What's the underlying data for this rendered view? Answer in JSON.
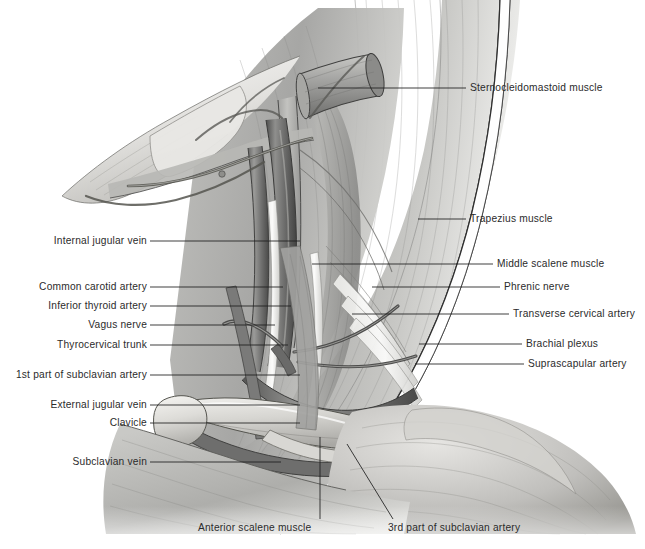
{
  "figure": {
    "background_color": "#ffffff",
    "label_color": "#2b2b2b",
    "leader_color": "#1e1e1e",
    "width": 645,
    "height": 549
  },
  "labels_left": [
    {
      "id": "internal-jugular-vein",
      "text": "Internal jugular vein",
      "x": 147,
      "y": 244,
      "leader": "M150,241 L300,241"
    },
    {
      "id": "common-carotid-artery",
      "text": "Common carotid artery",
      "x": 147,
      "y": 290,
      "leader": "M150,287 L283,287"
    },
    {
      "id": "inferior-thyroid-artery",
      "text": "Inferior thyroid artery",
      "x": 147,
      "y": 309,
      "leader": "M150,306 L291,306"
    },
    {
      "id": "vagus-nerve",
      "text": "Vagus nerve",
      "x": 147,
      "y": 328,
      "leader": "M150,325 L275,325"
    },
    {
      "id": "thyrocervical-trunk",
      "text": "Thyrocervical trunk",
      "x": 147,
      "y": 348,
      "leader": "M150,345 L288,345"
    },
    {
      "id": "first-part-subclavian",
      "text": "1st part of subclavian artery",
      "x": 147,
      "y": 378,
      "leader": "M150,375 L300,375"
    },
    {
      "id": "external-jugular-vein",
      "text": "External jugular vein",
      "x": 147,
      "y": 408,
      "leader": "M150,405 L300,405"
    },
    {
      "id": "clavicle",
      "text": "Clavicle",
      "x": 147,
      "y": 426,
      "leader": "M150,423 L300,423"
    },
    {
      "id": "subclavian-vein",
      "text": "Subclavian vein",
      "x": 147,
      "y": 465,
      "leader": "M150,462 L281,462"
    }
  ],
  "labels_right": [
    {
      "id": "sternocleidomastoid-muscle",
      "text": "Sternocleidomastoid muscle",
      "x": 470,
      "y": 91,
      "leader": "M466,88 L318,88"
    },
    {
      "id": "trapezius-muscle",
      "text": "Trapezius muscle",
      "x": 470,
      "y": 222,
      "leader": "M466,219 L418,219"
    },
    {
      "id": "middle-scalene-muscle",
      "text": "Middle scalene muscle",
      "x": 497,
      "y": 267,
      "leader": "M493,264 L312,264"
    },
    {
      "id": "phrenic-nerve",
      "text": "Phrenic nerve",
      "x": 504,
      "y": 290,
      "leader": "M500,287 L372,287"
    },
    {
      "id": "transverse-cervical-artery",
      "text": "Transverse cervical artery",
      "x": 513,
      "y": 317,
      "leader": "M509,314 L352,314"
    },
    {
      "id": "brachial-plexus",
      "text": "Brachial plexus",
      "x": 526,
      "y": 347,
      "leader": "M522,344 L419,344"
    },
    {
      "id": "suprascapular-artery",
      "text": "Suprascapular artery",
      "x": 528,
      "y": 367,
      "leader": "M524,364 L415,364"
    }
  ],
  "labels_bottom": [
    {
      "id": "anterior-scalene-muscle",
      "text": "Anterior scalene muscle",
      "x": 255,
      "y": 531,
      "leader": "M320,519 L320,437"
    },
    {
      "id": "third-part-subclavian",
      "text": "3rd part of subclavian artery",
      "x": 459,
      "y": 531,
      "leader": "M393,519 L347,444"
    }
  ],
  "ghost_footer": {
    "text": "",
    "visible": false
  },
  "palette": {
    "muscle_light": "#d8d8d6",
    "muscle_mid": "#b4b4b2",
    "muscle_dark": "#8e8e8c",
    "muscle_deep": "#6f6f6e",
    "vessel_dark": "#5a5a59",
    "vessel_mid": "#7e7e7d",
    "bone_light": "#e8e7e4",
    "bone_shadow": "#bdbcb8",
    "outline": "#3a3a3a",
    "skin_edge": "#ffffff"
  }
}
